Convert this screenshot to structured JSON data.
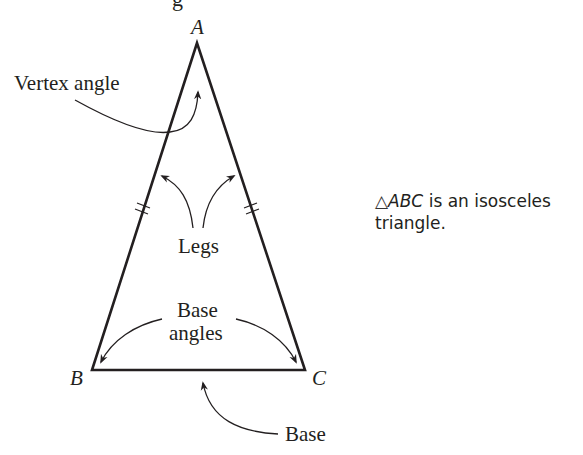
{
  "figure": {
    "top_fragment": "g",
    "vertices": {
      "A": {
        "label": "A",
        "x": 197,
        "y": 43
      },
      "B": {
        "label": "B",
        "x": 92,
        "y": 370
      },
      "C": {
        "label": "C",
        "x": 305,
        "y": 370
      }
    },
    "labels": {
      "vertex_angle": "Vertex angle",
      "legs": "Legs",
      "base_angles_line1": "Base",
      "base_angles_line2": "angles",
      "base": "Base"
    },
    "caption": {
      "symbol": "△",
      "name": "ABC",
      "line1_rest": " is an isosceles",
      "line2": "triangle."
    },
    "colors": {
      "stroke": "#231f20",
      "background": "#ffffff"
    }
  }
}
